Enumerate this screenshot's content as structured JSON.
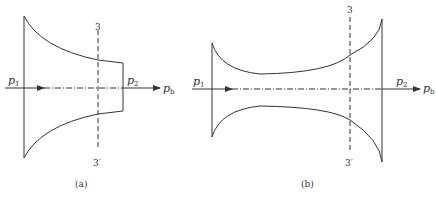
{
  "diagram_a": {
    "caption": "(a)",
    "inlet_pressure": "p",
    "inlet_sub": "1",
    "outlet_pressure": "p",
    "outlet_sub": "2",
    "back_pressure": "p",
    "back_sub": "b",
    "section_top": "3",
    "section_bottom": "3′"
  },
  "diagram_b": {
    "caption": "(b)",
    "inlet_pressure": "p",
    "inlet_sub": "1",
    "outlet_pressure": "p",
    "outlet_sub": "2",
    "back_pressure": "p",
    "back_sub": "b",
    "section_top": "3",
    "section_bottom": "3′"
  },
  "colors": {
    "line": "#333333"
  }
}
